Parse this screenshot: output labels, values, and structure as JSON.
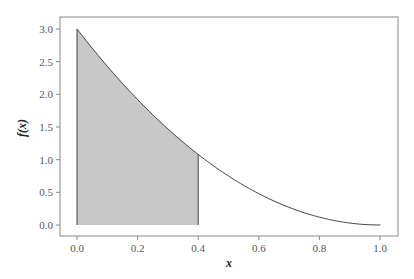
{
  "chart_data": {
    "type": "area",
    "title": "",
    "xlabel": "x",
    "ylabel": "f(x)",
    "xlim": [
      0.0,
      1.0
    ],
    "ylim": [
      0.0,
      3.0
    ],
    "x_ticks": [
      "0.0",
      "0.2",
      "0.4",
      "0.6",
      "0.8",
      "1.0"
    ],
    "y_ticks": [
      "0.0",
      "0.5",
      "1.0",
      "1.5",
      "2.0",
      "2.5",
      "3.0"
    ],
    "grid": false,
    "legend": null,
    "function": "f(x) = 3(1-x)^2",
    "series": [
      {
        "name": "f(x)",
        "x": [
          0.0,
          0.1,
          0.2,
          0.3,
          0.4,
          0.5,
          0.6,
          0.7,
          0.8,
          0.9,
          1.0
        ],
        "values": [
          3.0,
          2.43,
          1.92,
          1.47,
          1.08,
          0.75,
          0.48,
          0.27,
          0.12,
          0.03,
          0.0
        ]
      }
    ],
    "shaded_region": {
      "x_from": 0.0,
      "x_to": 0.4,
      "color": "#c8c8c8"
    },
    "colors": {
      "line": "#444444",
      "fill": "#c8c8c8",
      "frame": "#888888"
    }
  }
}
